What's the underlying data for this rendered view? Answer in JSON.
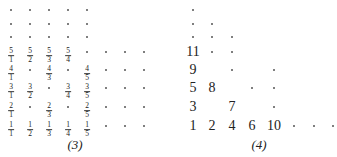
{
  "left_diagram": {
    "caption": "(3)",
    "columns_x": [
      11,
      30,
      49,
      68,
      87,
      106,
      125,
      144
    ],
    "rows_y": [
      10,
      24,
      37,
      52,
      70,
      88,
      107,
      126
    ],
    "rows": [
      [
        ".",
        ".",
        ".",
        ".",
        "."
      ],
      [
        ".",
        ".",
        ".",
        ".",
        "."
      ],
      [
        ".",
        ".",
        ".",
        ".",
        "."
      ],
      [
        "5/1",
        "5/2",
        "5/3",
        "5/4",
        ".",
        ".",
        ".",
        "."
      ],
      [
        "4/1",
        ".",
        "4/3",
        ".",
        "4/5",
        ".",
        ".",
        "."
      ],
      [
        "3/1",
        "3/2",
        ".",
        "3/4",
        "3/5",
        ".",
        ".",
        "."
      ],
      [
        "2/1",
        ".",
        "2/3",
        ".",
        "2/5",
        ".",
        ".",
        "."
      ],
      [
        "1/1",
        "1/2",
        "1/3",
        "1/4",
        "1/5",
        ".",
        ".",
        "."
      ]
    ]
  },
  "right_diagram": {
    "caption": "(4)",
    "columns_x": [
      193,
      212,
      232,
      252,
      274,
      294,
      314,
      333
    ],
    "rows_y": [
      10,
      24,
      37,
      52,
      70,
      88,
      107,
      126
    ],
    "rows": [
      [
        ".",
        "",
        "",
        "",
        "",
        "",
        "",
        ""
      ],
      [
        ".",
        ".",
        "",
        "",
        "",
        "",
        "",
        ""
      ],
      [
        ".",
        ".",
        ".",
        "",
        "",
        "",
        "",
        ""
      ],
      [
        "11",
        ".",
        ".",
        "",
        "",
        "",
        "",
        ""
      ],
      [
        "9",
        "",
        ".",
        "",
        ".",
        "",
        "",
        ""
      ],
      [
        "5",
        "8",
        "",
        ".",
        ".",
        "",
        "",
        ""
      ],
      [
        "3",
        "",
        "7",
        "",
        ".",
        "",
        "",
        ""
      ],
      [
        "1",
        "2",
        "4",
        "6",
        "10",
        ".",
        ".",
        "."
      ]
    ]
  }
}
